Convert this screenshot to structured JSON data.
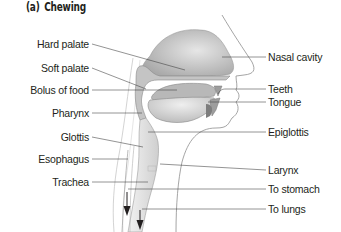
{
  "figure": {
    "panel_tag": "(a)",
    "panel_title": "Chewing"
  },
  "labels_left": [
    {
      "id": "hard-palate",
      "text": "Hard palate",
      "right": 252,
      "top": 38
    },
    {
      "id": "soft-palate",
      "text": "Soft palate",
      "right": 252,
      "top": 62
    },
    {
      "id": "bolus-of-food",
      "text": "Bolus of food",
      "right": 252,
      "top": 84
    },
    {
      "id": "pharynx",
      "text": "Pharynx",
      "right": 252,
      "top": 107
    },
    {
      "id": "glottis",
      "text": "Glottis",
      "right": 252,
      "top": 131
    },
    {
      "id": "esophagus",
      "text": "Esophagus",
      "right": 252,
      "top": 153
    },
    {
      "id": "trachea",
      "text": "Trachea",
      "right": 252,
      "top": 176
    }
  ],
  "labels_right": [
    {
      "id": "nasal-cavity",
      "text": "Nasal cavity",
      "left": 268,
      "top": 51
    },
    {
      "id": "teeth",
      "text": "Teeth",
      "left": 268,
      "top": 83
    },
    {
      "id": "tongue",
      "text": "Tongue",
      "left": 268,
      "top": 96
    },
    {
      "id": "epiglottis",
      "text": "Epiglottis",
      "left": 268,
      "top": 126
    },
    {
      "id": "larynx",
      "text": "Larynx",
      "left": 268,
      "top": 164
    },
    {
      "id": "to-stomach",
      "text": "To stomach",
      "left": 268,
      "top": 183
    },
    {
      "id": "to-lungs",
      "text": "To lungs",
      "left": 268,
      "top": 203
    }
  ],
  "colors": {
    "text": "#231f20",
    "leader_line": "#3a3a3a",
    "tissue_fill": "#d9d9d9",
    "tissue_dark": "#a8a8a8",
    "outline": "#8a8a8a"
  }
}
